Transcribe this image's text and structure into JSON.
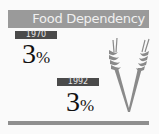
{
  "header": {
    "title": "Food Dependency"
  },
  "stats": [
    {
      "year": "1970",
      "value": "3",
      "unit": "%"
    },
    {
      "year": "1992",
      "value": "3",
      "unit": "%"
    }
  ],
  "icons": {
    "illustration": "wheat-icon"
  },
  "colors": {
    "header_bg": "#9a9a9a",
    "label_bg": "#4a4a4a",
    "wheat": "#8a8a8a",
    "footer_bar": "#8f8f8f"
  }
}
